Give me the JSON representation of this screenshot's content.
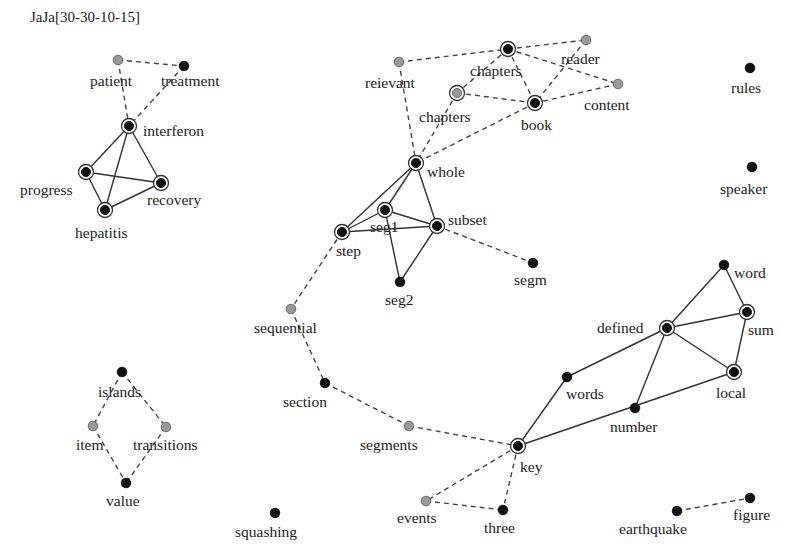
{
  "title": "JaJa[30-30-10-15]",
  "colors": {
    "black_node": "#111111",
    "gray_node": "#999999",
    "ring": "#333333",
    "text": "#222222"
  },
  "nodes": [
    {
      "id": "patient",
      "label": "patient",
      "x": 118,
      "y": 60,
      "fill": "gray",
      "ringed": false,
      "lx": 90,
      "ly": 86
    },
    {
      "id": "treatment",
      "label": "treatment",
      "x": 184,
      "y": 66,
      "fill": "black",
      "ringed": false,
      "lx": 161,
      "ly": 86
    },
    {
      "id": "interferon",
      "label": "interferon",
      "x": 129,
      "y": 126,
      "fill": "black",
      "ringed": true,
      "lx": 143,
      "ly": 136
    },
    {
      "id": "progress",
      "label": "progress",
      "x": 86,
      "y": 172,
      "fill": "black",
      "ringed": true,
      "lx": 20,
      "ly": 195
    },
    {
      "id": "recovery",
      "label": "recovery",
      "x": 161,
      "y": 183,
      "fill": "black",
      "ringed": true,
      "lx": 147,
      "ly": 205
    },
    {
      "id": "hepatitis",
      "label": "hepatitis",
      "x": 105,
      "y": 210,
      "fill": "black",
      "ringed": true,
      "lx": 75,
      "ly": 238
    },
    {
      "id": "reievant",
      "label": "reievant",
      "x": 399,
      "y": 62,
      "fill": "gray",
      "ringed": false,
      "lx": 365,
      "ly": 88
    },
    {
      "id": "chapters_top",
      "label": "chapters",
      "x": 508,
      "y": 49,
      "fill": "black",
      "ringed": true,
      "lx": 470,
      "ly": 76
    },
    {
      "id": "reader",
      "label": "reader",
      "x": 586,
      "y": 40,
      "fill": "gray",
      "ringed": false,
      "lx": 561,
      "ly": 64
    },
    {
      "id": "content",
      "label": "content",
      "x": 618,
      "y": 84,
      "fill": "gray",
      "ringed": false,
      "lx": 584,
      "ly": 110
    },
    {
      "id": "chapters_mid",
      "label": "chapters",
      "x": 457,
      "y": 93,
      "fill": "gray",
      "ringed": true,
      "lx": 419,
      "ly": 122
    },
    {
      "id": "book",
      "label": "book",
      "x": 535,
      "y": 103,
      "fill": "black",
      "ringed": true,
      "lx": 521,
      "ly": 130
    },
    {
      "id": "whole",
      "label": "whole",
      "x": 416,
      "y": 163,
      "fill": "black",
      "ringed": true,
      "lx": 427,
      "ly": 177
    },
    {
      "id": "seg1",
      "label": "seg1",
      "x": 385,
      "y": 210,
      "fill": "black",
      "ringed": true,
      "lx": 370,
      "ly": 232
    },
    {
      "id": "step",
      "label": "step",
      "x": 342,
      "y": 232,
      "fill": "black",
      "ringed": true,
      "lx": 336,
      "ly": 256
    },
    {
      "id": "subset",
      "label": "subset",
      "x": 437,
      "y": 226,
      "fill": "black",
      "ringed": true,
      "lx": 448,
      "ly": 225
    },
    {
      "id": "seg2",
      "label": "seg2",
      "x": 400,
      "y": 282,
      "fill": "black",
      "ringed": false,
      "lx": 385,
      "ly": 305
    },
    {
      "id": "segm",
      "label": "segm",
      "x": 533,
      "y": 263,
      "fill": "black",
      "ringed": false,
      "lx": 514,
      "ly": 285
    },
    {
      "id": "sequential",
      "label": "sequential",
      "x": 291,
      "y": 309,
      "fill": "gray",
      "ringed": false,
      "lx": 254,
      "ly": 333
    },
    {
      "id": "section",
      "label": "section",
      "x": 325,
      "y": 383,
      "fill": "black",
      "ringed": false,
      "lx": 283,
      "ly": 407
    },
    {
      "id": "segments",
      "label": "segments",
      "x": 409,
      "y": 426,
      "fill": "gray",
      "ringed": false,
      "lx": 360,
      "ly": 450
    },
    {
      "id": "key",
      "label": "key",
      "x": 518,
      "y": 446,
      "fill": "black",
      "ringed": true,
      "lx": 520,
      "ly": 472
    },
    {
      "id": "events",
      "label": "events",
      "x": 426,
      "y": 501,
      "fill": "gray",
      "ringed": false,
      "lx": 397,
      "ly": 523
    },
    {
      "id": "three",
      "label": "three",
      "x": 503,
      "y": 510,
      "fill": "black",
      "ringed": false,
      "lx": 484,
      "ly": 533
    },
    {
      "id": "words",
      "label": "words",
      "x": 567,
      "y": 377,
      "fill": "black",
      "ringed": false,
      "lx": 566,
      "ly": 399
    },
    {
      "id": "number",
      "label": "number",
      "x": 635,
      "y": 408,
      "fill": "black",
      "ringed": false,
      "lx": 610,
      "ly": 432
    },
    {
      "id": "defined",
      "label": "defined",
      "x": 667,
      "y": 328,
      "fill": "black",
      "ringed": true,
      "lx": 597,
      "ly": 333
    },
    {
      "id": "word",
      "label": "word",
      "x": 724,
      "y": 265,
      "fill": "black",
      "ringed": false,
      "lx": 734,
      "ly": 278
    },
    {
      "id": "sum",
      "label": "sum",
      "x": 747,
      "y": 312,
      "fill": "black",
      "ringed": true,
      "lx": 748,
      "ly": 335
    },
    {
      "id": "local",
      "label": "local",
      "x": 734,
      "y": 372,
      "fill": "black",
      "ringed": true,
      "lx": 716,
      "ly": 398
    },
    {
      "id": "rules",
      "label": "rules",
      "x": 750,
      "y": 68,
      "fill": "black",
      "ringed": false,
      "lx": 731,
      "ly": 93
    },
    {
      "id": "speaker",
      "label": "speaker",
      "x": 752,
      "y": 167,
      "fill": "black",
      "ringed": false,
      "lx": 720,
      "ly": 194
    },
    {
      "id": "islands",
      "label": "islands",
      "x": 122,
      "y": 372,
      "fill": "black",
      "ringed": false,
      "lx": 98,
      "ly": 397
    },
    {
      "id": "item",
      "label": "item",
      "x": 93,
      "y": 426,
      "fill": "gray",
      "ringed": false,
      "lx": 76,
      "ly": 450
    },
    {
      "id": "transitions",
      "label": "transitions",
      "x": 166,
      "y": 427,
      "fill": "gray",
      "ringed": false,
      "lx": 133,
      "ly": 450
    },
    {
      "id": "value",
      "label": "value",
      "x": 126,
      "y": 483,
      "fill": "black",
      "ringed": false,
      "lx": 106,
      "ly": 506
    },
    {
      "id": "squashing",
      "label": "squashing",
      "x": 275,
      "y": 513,
      "fill": "black",
      "ringed": false,
      "lx": 235,
      "ly": 537
    },
    {
      "id": "earthquake",
      "label": "earthquake",
      "x": 677,
      "y": 511,
      "fill": "black",
      "ringed": false,
      "lx": 619,
      "ly": 534
    },
    {
      "id": "figure",
      "label": "figure",
      "x": 750,
      "y": 498,
      "fill": "black",
      "ringed": false,
      "lx": 733,
      "ly": 520
    }
  ],
  "edges": [
    {
      "from": "patient",
      "to": "treatment",
      "style": "dashed"
    },
    {
      "from": "patient",
      "to": "interferon",
      "style": "dashed"
    },
    {
      "from": "treatment",
      "to": "interferon",
      "style": "dashed"
    },
    {
      "from": "interferon",
      "to": "progress",
      "style": "solid"
    },
    {
      "from": "interferon",
      "to": "recovery",
      "style": "solid"
    },
    {
      "from": "interferon",
      "to": "hepatitis",
      "style": "solid"
    },
    {
      "from": "progress",
      "to": "recovery",
      "style": "solid"
    },
    {
      "from": "progress",
      "to": "hepatitis",
      "style": "solid"
    },
    {
      "from": "recovery",
      "to": "hepatitis",
      "style": "solid"
    },
    {
      "from": "reievant",
      "to": "chapters_top",
      "style": "dashed"
    },
    {
      "from": "chapters_top",
      "to": "reader",
      "style": "dashed"
    },
    {
      "from": "chapters_top",
      "to": "content",
      "style": "dashed"
    },
    {
      "from": "chapters_top",
      "to": "chapters_mid",
      "style": "dashed"
    },
    {
      "from": "chapters_top",
      "to": "book",
      "style": "dashed"
    },
    {
      "from": "reader",
      "to": "book",
      "style": "dashed"
    },
    {
      "from": "content",
      "to": "book",
      "style": "dashed"
    },
    {
      "from": "chapters_mid",
      "to": "book",
      "style": "dashed"
    },
    {
      "from": "reievant",
      "to": "whole",
      "style": "dashed"
    },
    {
      "from": "chapters_mid",
      "to": "whole",
      "style": "dashed"
    },
    {
      "from": "book",
      "to": "whole",
      "style": "dashed"
    },
    {
      "from": "whole",
      "to": "step",
      "style": "solid"
    },
    {
      "from": "whole",
      "to": "seg1",
      "style": "solid"
    },
    {
      "from": "whole",
      "to": "subset",
      "style": "solid"
    },
    {
      "from": "step",
      "to": "seg1",
      "style": "solid"
    },
    {
      "from": "step",
      "to": "subset",
      "style": "solid"
    },
    {
      "from": "seg1",
      "to": "subset",
      "style": "solid"
    },
    {
      "from": "seg1",
      "to": "seg2",
      "style": "solid"
    },
    {
      "from": "subset",
      "to": "seg2",
      "style": "solid"
    },
    {
      "from": "subset",
      "to": "segm",
      "style": "dashed"
    },
    {
      "from": "step",
      "to": "sequential",
      "style": "dashed"
    },
    {
      "from": "sequential",
      "to": "section",
      "style": "dashed"
    },
    {
      "from": "section",
      "to": "segments",
      "style": "dashed"
    },
    {
      "from": "segments",
      "to": "key",
      "style": "dashed"
    },
    {
      "from": "key",
      "to": "events",
      "style": "dashed"
    },
    {
      "from": "key",
      "to": "three",
      "style": "dashed"
    },
    {
      "from": "events",
      "to": "three",
      "style": "dashed"
    },
    {
      "from": "key",
      "to": "words",
      "style": "solid"
    },
    {
      "from": "key",
      "to": "local",
      "style": "solid"
    },
    {
      "from": "words",
      "to": "defined",
      "style": "solid"
    },
    {
      "from": "defined",
      "to": "number",
      "style": "solid"
    },
    {
      "from": "defined",
      "to": "word",
      "style": "solid"
    },
    {
      "from": "defined",
      "to": "sum",
      "style": "solid"
    },
    {
      "from": "defined",
      "to": "local",
      "style": "solid"
    },
    {
      "from": "word",
      "to": "sum",
      "style": "solid"
    },
    {
      "from": "sum",
      "to": "local",
      "style": "solid"
    },
    {
      "from": "islands",
      "to": "item",
      "style": "dashed"
    },
    {
      "from": "islands",
      "to": "transitions",
      "style": "dashed"
    },
    {
      "from": "item",
      "to": "value",
      "style": "dashed"
    },
    {
      "from": "transitions",
      "to": "value",
      "style": "dashed"
    },
    {
      "from": "earthquake",
      "to": "figure",
      "style": "dashed"
    }
  ]
}
